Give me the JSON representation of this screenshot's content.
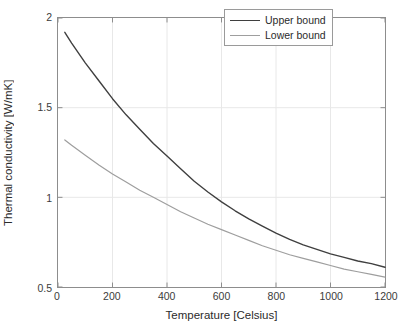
{
  "chart_data": {
    "type": "line",
    "title": "",
    "xlabel": "Temperature [Celsius]",
    "ylabel": "Thermal conductivity [W/mK]",
    "xlim": [
      0,
      1200
    ],
    "ylim": [
      0.5,
      2
    ],
    "xticks": [
      0,
      200,
      400,
      600,
      800,
      1000,
      1200
    ],
    "yticks": [
      0.5,
      1,
      1.5,
      2
    ],
    "xtick_labels": [
      "0",
      "200",
      "400",
      "600",
      "800",
      "1000",
      "1200"
    ],
    "ytick_labels": [
      "0.5",
      "1",
      "1.5",
      "2"
    ],
    "grid": true,
    "legend_position": "top-right",
    "series": [
      {
        "name": "Upper bound",
        "color": "#3f3f3f",
        "width": 1.4,
        "x": [
          25,
          50,
          100,
          150,
          200,
          250,
          300,
          350,
          400,
          450,
          500,
          550,
          600,
          650,
          700,
          750,
          800,
          850,
          900,
          950,
          1000,
          1050,
          1100,
          1150,
          1200
        ],
        "y": [
          1.92,
          1.86,
          1.75,
          1.65,
          1.55,
          1.46,
          1.38,
          1.3,
          1.23,
          1.16,
          1.09,
          1.03,
          0.975,
          0.925,
          0.88,
          0.84,
          0.8,
          0.765,
          0.735,
          0.71,
          0.685,
          0.665,
          0.645,
          0.63,
          0.61
        ]
      },
      {
        "name": "Lower bound",
        "color": "#9e9e9e",
        "width": 1.2,
        "x": [
          25,
          50,
          100,
          150,
          200,
          250,
          300,
          350,
          400,
          450,
          500,
          550,
          600,
          650,
          700,
          750,
          800,
          850,
          900,
          950,
          1000,
          1050,
          1100,
          1150,
          1200
        ],
        "y": [
          1.32,
          1.29,
          1.235,
          1.18,
          1.13,
          1.085,
          1.04,
          1.0,
          0.96,
          0.92,
          0.885,
          0.85,
          0.82,
          0.79,
          0.76,
          0.73,
          0.705,
          0.68,
          0.66,
          0.64,
          0.62,
          0.6,
          0.585,
          0.57,
          0.555
        ]
      }
    ]
  },
  "legend": {
    "entries": [
      {
        "label": "Upper bound"
      },
      {
        "label": "Lower bound"
      }
    ]
  },
  "colors": {
    "upper_bound": "#3f3f3f",
    "lower_bound": "#9e9e9e",
    "axis": "#8d8d8d",
    "grid": "#e8e8e8",
    "text": "#2b2b2b",
    "background": "#ffffff"
  }
}
